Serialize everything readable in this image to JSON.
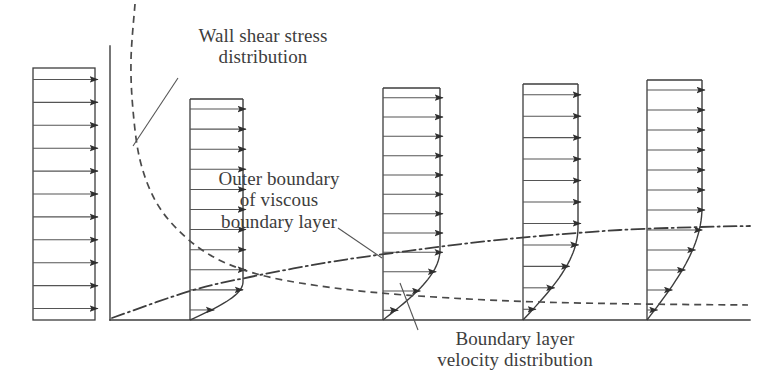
{
  "figure": {
    "domain_title": "Boundary layer growth along a flat plate",
    "width": 762,
    "height": 389,
    "background_color": "#ffffff",
    "line_color": "#3d3d3d",
    "text_color": "#3d3d3d"
  },
  "annotations": [
    {
      "id": "wall-shear-stress-label",
      "name": "wall-shear-stress-distribution-label",
      "lines": [
        "Wall shear stress",
        "distribution"
      ],
      "text": "Wall shear stress distribution",
      "x": 168,
      "y": 25,
      "width": 190,
      "align": "ann-center",
      "leader": {
        "x1": 178,
        "y1": 78,
        "x2": 133,
        "y2": 146
      }
    },
    {
      "id": "outer-boundary-label",
      "name": "outer-boundary-of-viscous-boundary-layer-label",
      "lines": [
        "Outer boundary",
        "of viscous",
        "boundary layer"
      ],
      "text": "Outer boundary of viscous boundary layer",
      "x": 198,
      "y": 168,
      "width": 162,
      "align": "ann-center",
      "leader": {
        "x1": 338,
        "y1": 228,
        "x2": 382,
        "y2": 258
      }
    },
    {
      "id": "boundary-layer-velocity-label",
      "name": "boundary-layer-velocity-distribution-label",
      "lines": [
        "Boundary layer",
        "velocity distribution"
      ],
      "text": "Boundary layer velocity distribution",
      "x": 410,
      "y": 328,
      "width": 210,
      "align": "ann-center",
      "leader": {
        "x1": 418,
        "y1": 330,
        "x2": 400,
        "y2": 283
      }
    }
  ],
  "chart_data": {
    "type": "diagram",
    "ground_line": {
      "x1": 110,
      "y1": 320,
      "x2": 750,
      "y2": 320
    },
    "inlet_axis": {
      "x": 110,
      "y1": 46,
      "y2": 320
    },
    "freestream_block": {
      "name": "uniform-inlet-velocity-profile",
      "x_left": 33,
      "x_right": 95,
      "y_top": 68,
      "y_bottom": 320,
      "arrow_count": 11,
      "profile": "uniform"
    },
    "stations": [
      {
        "name": "station-1",
        "x_wall": 190,
        "x_edge": 243,
        "y_top": 99,
        "y_bottom": 320,
        "delta": 38,
        "arrow_count": 11,
        "profile": "blasius"
      },
      {
        "name": "station-2",
        "x_wall": 383,
        "x_edge": 440,
        "y_top": 88,
        "y_bottom": 320,
        "delta": 70,
        "arrow_count": 12,
        "profile": "blasius"
      },
      {
        "name": "station-3",
        "x_wall": 523,
        "x_edge": 578,
        "y_top": 84,
        "y_bottom": 320,
        "delta": 92,
        "arrow_count": 11,
        "profile": "blasius"
      },
      {
        "name": "station-4",
        "x_wall": 647,
        "x_edge": 702,
        "y_top": 80,
        "y_bottom": 320,
        "delta": 112,
        "arrow_count": 12,
        "profile": "blasius"
      }
    ],
    "boundary_layer_edge_curve": {
      "name": "outer-boundary-dash-dot-curve",
      "style": "dash-dot",
      "points": [
        [
          112,
          318
        ],
        [
          190,
          291
        ],
        [
          250,
          277
        ],
        [
          330,
          262
        ],
        [
          400,
          252
        ],
        [
          470,
          243
        ],
        [
          540,
          236
        ],
        [
          620,
          230
        ],
        [
          700,
          227
        ],
        [
          750,
          226
        ]
      ]
    },
    "wall_shear_stress_curve": {
      "name": "wall-shear-stress-dashed-curve",
      "style": "dashed",
      "points": [
        [
          135,
          4
        ],
        [
          131,
          60
        ],
        [
          133,
          110
        ],
        [
          140,
          160
        ],
        [
          155,
          200
        ],
        [
          178,
          230
        ],
        [
          210,
          255
        ],
        [
          250,
          272
        ],
        [
          300,
          283
        ],
        [
          370,
          292
        ],
        [
          450,
          298
        ],
        [
          540,
          302
        ],
        [
          640,
          304
        ],
        [
          748,
          305
        ]
      ]
    }
  }
}
